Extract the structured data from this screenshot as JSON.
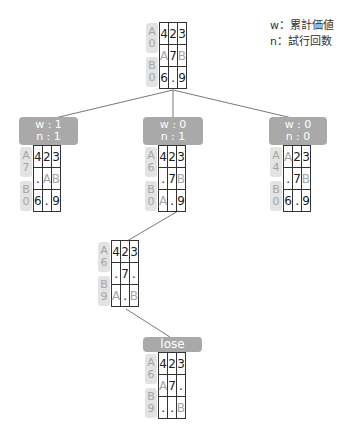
{
  "legend": {
    "w_line": "w：累計価値",
    "n_line": "n：試行回数"
  },
  "nodes": {
    "root": {
      "side": {
        "a_label": "A",
        "a_value": "0",
        "b_label": "B",
        "b_value": "0"
      },
      "cells": [
        [
          "4",
          "2",
          "3"
        ],
        [
          "A",
          "7",
          "B"
        ],
        [
          "6",
          ".",
          "9"
        ]
      ]
    },
    "left": {
      "label": {
        "w": "w : 1",
        "n": "n : 1"
      },
      "side": {
        "a_label": "A",
        "a_value": "7",
        "b_label": "B",
        "b_value": "0"
      },
      "cells": [
        [
          "4",
          "2",
          "3"
        ],
        [
          ".",
          "A",
          "B"
        ],
        [
          "6",
          ".",
          "9"
        ]
      ]
    },
    "center": {
      "label": {
        "w": "w : 0",
        "n": "n : 1"
      },
      "side": {
        "a_label": "A",
        "a_value": "6",
        "b_label": "B",
        "b_value": "0"
      },
      "cells": [
        [
          "4",
          "2",
          "3"
        ],
        [
          ".",
          "7",
          "B"
        ],
        [
          "A",
          ".",
          "9"
        ]
      ]
    },
    "right": {
      "label": {
        "w": "w : 0",
        "n": "n : 0"
      },
      "side": {
        "a_label": "A",
        "a_value": "4",
        "b_label": "B",
        "b_value": "0"
      },
      "cells": [
        [
          "A",
          "2",
          "3"
        ],
        [
          ".",
          "7",
          "B"
        ],
        [
          "6",
          ".",
          "9"
        ]
      ]
    },
    "third": {
      "side": {
        "a_label": "A",
        "a_value": "6",
        "b_label": "B",
        "b_value": "9"
      },
      "cells": [
        [
          "4",
          "2",
          "3"
        ],
        [
          ".",
          "7",
          "."
        ],
        [
          "A",
          ".",
          "B"
        ]
      ]
    },
    "final": {
      "label": {
        "result": "lose"
      },
      "side": {
        "a_label": "A",
        "a_value": "6",
        "b_label": "B",
        "b_value": "9"
      },
      "cells": [
        [
          "4",
          "2",
          "3"
        ],
        [
          "A",
          "7",
          "."
        ],
        [
          ".",
          ".",
          "B"
        ]
      ]
    }
  },
  "colors": {
    "label_bg": "#a9a9a9",
    "side_bg": "#e3e3e3",
    "muted_text": "#a5a5a5",
    "edge": "#777777"
  }
}
